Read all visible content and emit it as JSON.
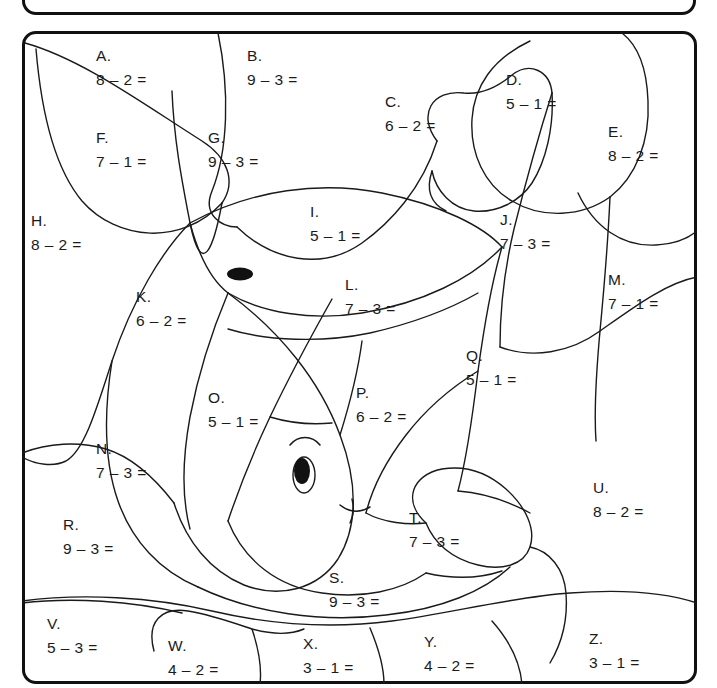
{
  "worksheet": {
    "instruction_box": {
      "visible_fragment": "",
      "note": "top instruction box cropped off at top edge"
    },
    "frame": {
      "border_color": "#111111",
      "background": "#ffffff"
    },
    "picture": {
      "subject": "fish",
      "details": [
        "dorsal-spot",
        "eye",
        "eyebrow",
        "mouth",
        "fin-lines"
      ]
    },
    "regions": [
      {
        "id": "A",
        "letter": "A.",
        "expr": "8 – 2 =",
        "x": 96,
        "y": 44
      },
      {
        "id": "B",
        "letter": "B.",
        "expr": "9 – 3 =",
        "x": 247,
        "y": 44
      },
      {
        "id": "C",
        "letter": "C.",
        "expr": "6 – 2 =",
        "x": 385,
        "y": 90
      },
      {
        "id": "D",
        "letter": "D.",
        "expr": "5 – 1 =",
        "x": 506,
        "y": 68
      },
      {
        "id": "E",
        "letter": "E.",
        "expr": "8 – 2 =",
        "x": 608,
        "y": 120
      },
      {
        "id": "F",
        "letter": "F.",
        "expr": "7 – 1 =",
        "x": 96,
        "y": 126
      },
      {
        "id": "G",
        "letter": "G.",
        "expr": "9 – 3 =",
        "x": 208,
        "y": 126
      },
      {
        "id": "H",
        "letter": "H.",
        "expr": "8 – 2 =",
        "x": 31,
        "y": 209
      },
      {
        "id": "I",
        "letter": "I.",
        "expr": "5 – 1 =",
        "x": 310,
        "y": 200
      },
      {
        "id": "J",
        "letter": "J.",
        "expr": "7 – 3 =",
        "x": 500,
        "y": 208
      },
      {
        "id": "K",
        "letter": "K.",
        "expr": "6 – 2 =",
        "x": 136,
        "y": 285
      },
      {
        "id": "L",
        "letter": "L.",
        "expr": "7 – 3 =",
        "x": 345,
        "y": 273
      },
      {
        "id": "M",
        "letter": "M.",
        "expr": "7 – 1 =",
        "x": 608,
        "y": 268
      },
      {
        "id": "N",
        "letter": "N.",
        "expr": "7 – 3 =",
        "x": 96,
        "y": 437
      },
      {
        "id": "O",
        "letter": "O.",
        "expr": "5 – 1 =",
        "x": 208,
        "y": 386
      },
      {
        "id": "P",
        "letter": "P.",
        "expr": "6 – 2 =",
        "x": 356,
        "y": 381
      },
      {
        "id": "Q",
        "letter": "Q.",
        "expr": "5 – 1 =",
        "x": 466,
        "y": 344
      },
      {
        "id": "R",
        "letter": "R.",
        "expr": "9 – 3 =",
        "x": 63,
        "y": 513
      },
      {
        "id": "S",
        "letter": "S.",
        "expr": "9 – 3 =",
        "x": 329,
        "y": 566
      },
      {
        "id": "T",
        "letter": "T.",
        "expr": "7 – 3 =",
        "x": 409,
        "y": 506
      },
      {
        "id": "U",
        "letter": "U.",
        "expr": "8 – 2 =",
        "x": 593,
        "y": 476
      },
      {
        "id": "V",
        "letter": "V.",
        "expr": "5 – 3 =",
        "x": 47,
        "y": 612
      },
      {
        "id": "W",
        "letter": "W.",
        "expr": "4 – 2 =",
        "x": 168,
        "y": 634
      },
      {
        "id": "X",
        "letter": "X.",
        "expr": "3 – 1 =",
        "x": 303,
        "y": 632
      },
      {
        "id": "Y",
        "letter": "Y.",
        "expr": "4 – 2 =",
        "x": 424,
        "y": 630
      },
      {
        "id": "Z",
        "letter": "Z.",
        "expr": "3 – 1 =",
        "x": 589,
        "y": 627
      }
    ]
  }
}
